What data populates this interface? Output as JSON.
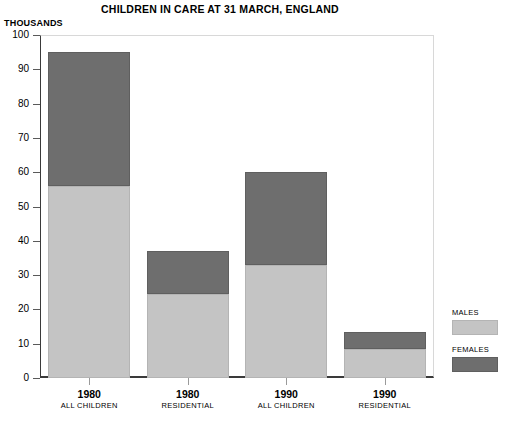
{
  "chart_data": {
    "type": "bar",
    "subtype": "stacked",
    "title": "CHILDREN IN CARE AT 31 MARCH, ENGLAND",
    "units_label": "THOUSANDS",
    "xlabel": "",
    "ylabel": "",
    "ylim": [
      0,
      100
    ],
    "ytick_values": [
      0,
      10,
      20,
      30,
      40,
      50,
      60,
      70,
      80,
      90,
      100
    ],
    "ytick_labels": [
      "0",
      "10",
      "20",
      "30",
      "40",
      "50",
      "60",
      "70",
      "80",
      "90",
      "100"
    ],
    "grid": false,
    "legend_position": "right",
    "categories": [
      "1980",
      "1980",
      "1990",
      "1990"
    ],
    "category_sublabels": [
      "ALL CHILDREN",
      "RESIDENTIAL",
      "ALL CHILDREN",
      "RESIDENTIAL"
    ],
    "series": [
      {
        "name": "MALES",
        "color": "#c4c4c4",
        "values": [
          56,
          24.5,
          33,
          8.5
        ]
      },
      {
        "name": "FEMALES",
        "color": "#6e6e6e",
        "values": [
          39,
          12.5,
          27,
          5
        ]
      }
    ],
    "totals": [
      95,
      37,
      60,
      13.5
    ]
  },
  "legend": {
    "entries": [
      {
        "label": "MALES",
        "swatch": "males"
      },
      {
        "label": "FEMALES",
        "swatch": "females"
      }
    ]
  }
}
